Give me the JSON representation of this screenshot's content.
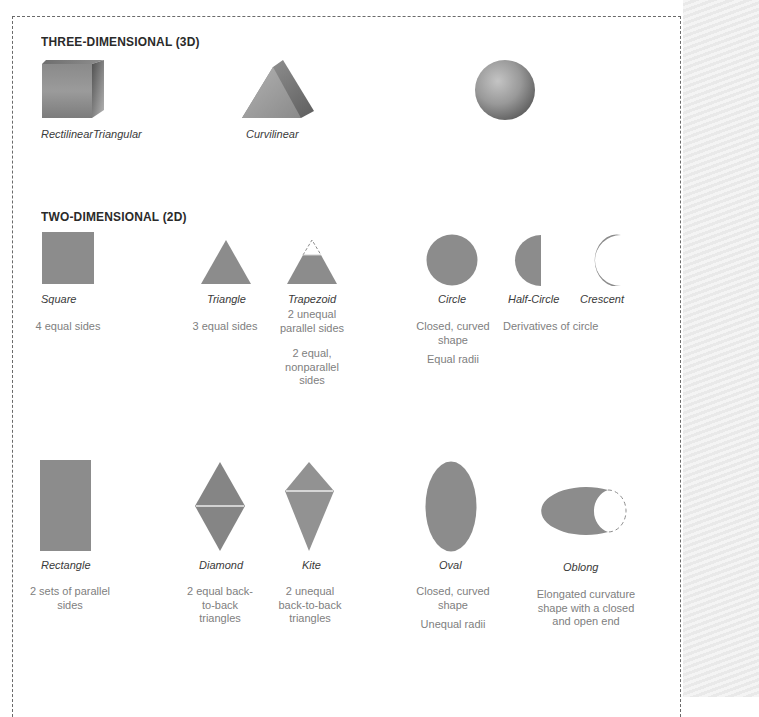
{
  "sections": {
    "three_d": {
      "title": "THREE-DIMENSIONAL (3D)",
      "items": [
        {
          "shape": "cube-icon",
          "label": "RectilinearTriangular"
        },
        {
          "shape": "prism-icon",
          "label": "Curvilinear"
        },
        {
          "shape": "sphere-icon",
          "label": ""
        }
      ]
    },
    "two_d": {
      "title": "TWO-DIMENSIONAL (2D)",
      "row1": [
        {
          "shape": "square-icon",
          "label": "Square",
          "desc": [
            "4 equal sides"
          ]
        },
        {
          "shape": "triangle-icon",
          "label": "Triangle",
          "desc": [
            "3 equal sides"
          ]
        },
        {
          "shape": "trapezoid-icon",
          "label": "Trapezoid",
          "desc": [
            "2 unequal parallel sides",
            "2 equal, nonparallel sides"
          ]
        },
        {
          "shape": "circle-icon",
          "label": "Circle",
          "desc": [
            "Closed, curved shape",
            "Equal radii"
          ]
        },
        {
          "shape": "half-circle-icon",
          "label": "Half-Circle",
          "desc": []
        },
        {
          "shape": "crescent-icon",
          "label": "Crescent",
          "desc": []
        }
      ],
      "circle_derivatives_note": "Derivatives of circle",
      "row2": [
        {
          "shape": "rectangle-icon",
          "label": "Rectangle",
          "desc": [
            "2 sets of parallel sides"
          ]
        },
        {
          "shape": "diamond-icon",
          "label": "Diamond",
          "desc": [
            "2 equal back-to-back triangles"
          ]
        },
        {
          "shape": "kite-icon",
          "label": "Kite",
          "desc": [
            "2 unequal back-to-back triangles"
          ]
        },
        {
          "shape": "oval-icon",
          "label": "Oval",
          "desc": [
            "Closed, curved shape",
            "Unequal radii"
          ]
        },
        {
          "shape": "oblong-icon",
          "label": "Oblong",
          "desc": [
            "Elongated curvature shape with a closed and open end"
          ]
        }
      ]
    }
  },
  "colors": {
    "shape_fill": "#8c8c8c",
    "title_text": "#2a2a2a",
    "label_text": "#3a3a3a",
    "desc_text": "#808080",
    "frame_border": "#6a6a6a"
  }
}
